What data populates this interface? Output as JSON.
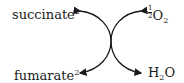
{
  "diagram": {
    "type": "coupled-reaction",
    "left_top": {
      "name": "succinate",
      "charge": "2−"
    },
    "left_bottom": {
      "name": "fumarate",
      "charge": "2−"
    },
    "right_top": {
      "coef_num": "1",
      "coef_den": "2",
      "formula": "O",
      "subscript": "2"
    },
    "right_bottom": {
      "formula_a": "H",
      "subscript": "2",
      "formula_b": "O"
    },
    "colors": {
      "ink": "#1a1a1a",
      "background": "#ffffff"
    }
  }
}
